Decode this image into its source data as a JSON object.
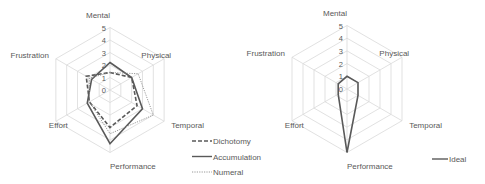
{
  "chart_data": [
    {
      "type": "radar",
      "title": "",
      "categories": [
        "Mental",
        "Physical",
        "Temporal",
        "Performance",
        "Effort",
        "Frustration"
      ],
      "axis": {
        "min": 0,
        "max": 5,
        "ticks": [
          "0",
          "1",
          "2",
          "3",
          "4",
          "5"
        ]
      },
      "grid": true,
      "legend_position": "right-bottom",
      "series": [
        {
          "name": "Dichotomy",
          "style": "dashed",
          "color": "#595959",
          "values": [
            1.4,
            2.0,
            2.5,
            3.0,
            1.9,
            2.2
          ]
        },
        {
          "name": "Accumulation",
          "style": "solid",
          "color": "#595959",
          "values": [
            2.2,
            2.0,
            3.0,
            4.3,
            2.1,
            1.7
          ]
        },
        {
          "name": "Numeral",
          "style": "dotted",
          "color": "#8c8c8c",
          "values": [
            1.4,
            2.6,
            4.0,
            3.5,
            1.9,
            1.9
          ]
        }
      ]
    },
    {
      "type": "radar",
      "title": "",
      "categories": [
        "Mental",
        "Physical",
        "Temporal",
        "Performance",
        "Effort",
        "Frustration"
      ],
      "axis": {
        "min": 0,
        "max": 5,
        "ticks": [
          "0",
          "1",
          "2",
          "3",
          "4",
          "5"
        ]
      },
      "grid": true,
      "legend_position": "right-bottom",
      "series": [
        {
          "name": "Ideal",
          "style": "solid",
          "color": "#595959",
          "values": [
            1.0,
            1.0,
            1.0,
            5.0,
            0.8,
            0.8
          ]
        }
      ]
    }
  ]
}
